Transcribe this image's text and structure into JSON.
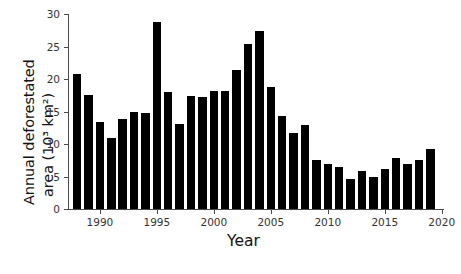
{
  "chart_data": {
    "type": "bar",
    "title": "",
    "xlabel": "Year",
    "ylabel_line1": "Annual deforestated",
    "ylabel_line2": "area (10³ km²)",
    "ylabel": "Annual deforestated area (10³ km²)",
    "bar_color": "#000000",
    "axis_color": "#4a4a4a",
    "grid": false,
    "legend": null,
    "xlim": [
      1987.2,
      2020.2
    ],
    "ylim": [
      0,
      30
    ],
    "yticks": [
      0,
      5,
      10,
      15,
      20,
      25,
      30
    ],
    "ytick_labels": [
      "0",
      "5",
      "10",
      "15",
      "20",
      "25",
      "30"
    ],
    "xticks": [
      1990,
      1995,
      2000,
      2005,
      2010,
      2015,
      2020
    ],
    "xtick_labels": [
      "1990",
      "1995",
      "2000",
      "2005",
      "2010",
      "2015",
      "2020"
    ],
    "categories": [
      1988,
      1989,
      1990,
      1991,
      1992,
      1993,
      1994,
      1995,
      1996,
      1997,
      1998,
      1999,
      2000,
      2001,
      2002,
      2003,
      2004,
      2005,
      2006,
      2007,
      2008,
      2009,
      2010,
      2011,
      2012,
      2013,
      2014,
      2015,
      2016,
      2017,
      2018,
      2019
    ],
    "values": [
      20.8,
      17.6,
      13.4,
      11.0,
      13.8,
      14.9,
      14.7,
      28.8,
      18.0,
      13.1,
      17.4,
      17.3,
      18.2,
      18.2,
      21.4,
      25.4,
      27.4,
      18.8,
      14.3,
      11.7,
      12.9,
      7.5,
      7.0,
      6.4,
      4.6,
      5.9,
      5.0,
      6.2,
      7.9,
      6.9,
      7.5,
      9.2
    ]
  },
  "caption": {
    "text": ""
  }
}
